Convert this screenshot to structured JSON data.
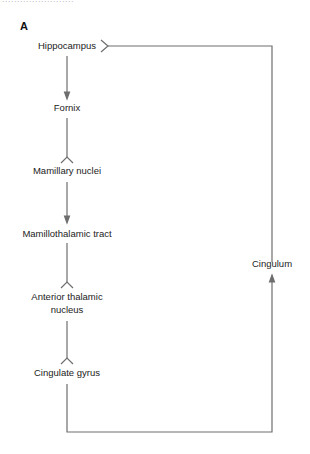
{
  "header": {
    "cut_text": "........................",
    "panel_label": "A"
  },
  "nodes": [
    {
      "id": "hippocampus",
      "label": "Hippocampus"
    },
    {
      "id": "fornix",
      "label": "Fornix"
    },
    {
      "id": "mamillary",
      "label": "Mamillary nuclei"
    },
    {
      "id": "mamillothalamic",
      "label": "Mamillothalamic tract"
    },
    {
      "id": "anterior_thalamic_1",
      "label": "Anterior thalamic"
    },
    {
      "id": "anterior_thalamic_2",
      "label": "nucleus"
    },
    {
      "id": "cingulate",
      "label": "Cingulate gyrus"
    },
    {
      "id": "cingulum",
      "label": "Cingulum"
    }
  ],
  "edges": [
    {
      "from": "Hippocampus",
      "to": "Fornix",
      "type": "arrow"
    },
    {
      "from": "Fornix",
      "to": "Mamillary nuclei",
      "type": "fork"
    },
    {
      "from": "Mamillary nuclei",
      "to": "Mamillothalamic tract",
      "type": "arrow"
    },
    {
      "from": "Mamillothalamic tract",
      "to": "Anterior thalamic nucleus",
      "type": "fork"
    },
    {
      "from": "Anterior thalamic nucleus",
      "to": "Cingulate gyrus",
      "type": "fork"
    },
    {
      "from": "Cingulate gyrus",
      "to": "Cingulum",
      "type": "arrow"
    },
    {
      "from": "Cingulum",
      "to": "Hippocampus",
      "type": "fork"
    }
  ],
  "colors": {
    "line": "#6e6e6e",
    "text": "#222222"
  }
}
